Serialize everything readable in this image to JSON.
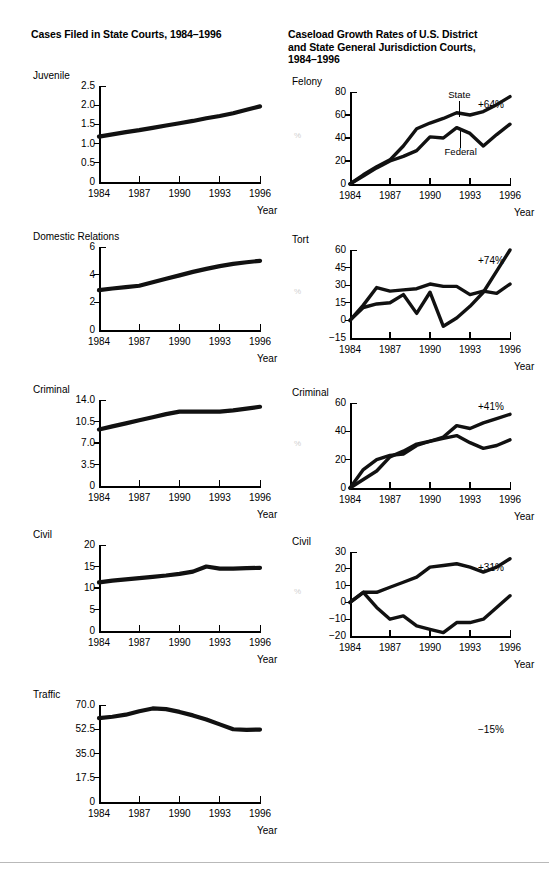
{
  "left_column": {
    "title": "Cases Filed in State Courts, 1984–1996",
    "xaxis_label": "Year"
  },
  "right_column": {
    "title": "Caseload Growth Rates of U.S. District\nand State General Jurisdiction Courts,\n1984–1996",
    "xaxis_label": "Year"
  },
  "felony_series_labels": {
    "state": "State",
    "federal": "Federal"
  },
  "footer": {
    "divider": ""
  },
  "chart_data": [
    {
      "id": "juvenile",
      "type": "line",
      "title": "Juvenile",
      "xlabel": "Year",
      "ylabel": "",
      "annotation": "+64%",
      "xticks": [
        "1984",
        "1987",
        "1990",
        "1993",
        "1996"
      ],
      "yticks": [
        "0",
        "0.5",
        "1.0",
        "1.5",
        "2.0",
        "2.5"
      ],
      "ylim": [
        0,
        2.5
      ],
      "xlim": [
        1984,
        1996
      ],
      "x": [
        1984,
        1985,
        1986,
        1987,
        1988,
        1989,
        1990,
        1991,
        1992,
        1993,
        1994,
        1995,
        1996
      ],
      "values": [
        1.18,
        1.24,
        1.3,
        1.35,
        1.41,
        1.47,
        1.53,
        1.59,
        1.66,
        1.72,
        1.79,
        1.88,
        1.97
      ]
    },
    {
      "id": "domestic-relations",
      "type": "line",
      "title": "Domestic Relations",
      "xlabel": "Year",
      "ylabel": "",
      "annotation": "+74%",
      "xticks": [
        "1984",
        "1987",
        "1990",
        "1993",
        "1996"
      ],
      "yticks": [
        "0",
        "2",
        "4",
        "6"
      ],
      "ylim": [
        0,
        6
      ],
      "xlim": [
        1984,
        1996
      ],
      "x": [
        1984,
        1985,
        1986,
        1987,
        1988,
        1989,
        1990,
        1991,
        1992,
        1993,
        1994,
        1995,
        1996
      ],
      "values": [
        2.88,
        3.0,
        3.1,
        3.2,
        3.45,
        3.7,
        3.95,
        4.2,
        4.42,
        4.62,
        4.78,
        4.9,
        5.0
      ]
    },
    {
      "id": "criminal-state",
      "type": "line",
      "title": "Criminal",
      "xlabel": "Year",
      "ylabel": "",
      "annotation": "+41%",
      "xticks": [
        "1984",
        "1987",
        "1990",
        "1993",
        "1996"
      ],
      "yticks": [
        "0",
        "3.5",
        "7.0",
        "10.5",
        "14.0"
      ],
      "ylim": [
        0,
        14
      ],
      "xlim": [
        1984,
        1996
      ],
      "x": [
        1984,
        1985,
        1986,
        1987,
        1988,
        1989,
        1990,
        1991,
        1992,
        1993,
        1994,
        1995,
        1996
      ],
      "values": [
        9.2,
        9.7,
        10.2,
        10.7,
        11.2,
        11.7,
        12.1,
        12.1,
        12.1,
        12.1,
        12.3,
        12.6,
        12.9
      ]
    },
    {
      "id": "civil-state",
      "type": "line",
      "title": "Civil",
      "xlabel": "Year",
      "ylabel": "",
      "annotation": "+31%",
      "xticks": [
        "1984",
        "1987",
        "1990",
        "1993",
        "1996"
      ],
      "yticks": [
        "0",
        "5",
        "10",
        "15",
        "20"
      ],
      "ylim": [
        0,
        20
      ],
      "xlim": [
        1984,
        1996
      ],
      "x": [
        1984,
        1985,
        1986,
        1987,
        1988,
        1989,
        1990,
        1991,
        1992,
        1993,
        1994,
        1995,
        1996
      ],
      "values": [
        11.3,
        11.7,
        12.0,
        12.3,
        12.6,
        12.9,
        13.3,
        13.8,
        15.0,
        14.5,
        14.5,
        14.6,
        14.7
      ]
    },
    {
      "id": "traffic",
      "type": "line",
      "title": "Traffic",
      "xlabel": "Year",
      "ylabel": "",
      "annotation": "−15%",
      "xticks": [
        "1984",
        "1987",
        "1990",
        "1993",
        "1996"
      ],
      "yticks": [
        "0",
        "17.5",
        "35.0",
        "52.5",
        "70.0"
      ],
      "ylim": [
        0,
        70
      ],
      "xlim": [
        1984,
        1996
      ],
      "x": [
        1984,
        1985,
        1986,
        1987,
        1988,
        1989,
        1990,
        1991,
        1992,
        1993,
        1994,
        1995,
        1996
      ],
      "values": [
        60.5,
        61.5,
        63.0,
        65.5,
        67.5,
        67.0,
        65.0,
        62.5,
        59.5,
        56.0,
        52.5,
        52.0,
        52.3
      ]
    },
    {
      "id": "felony-growth",
      "type": "line",
      "title": "Felony",
      "xlabel": "Year",
      "ylabel": "%",
      "annotation": "",
      "xticks": [
        "1984",
        "1987",
        "1990",
        "1993",
        "1996"
      ],
      "yticks": [
        "0",
        "20",
        "40",
        "60",
        "80"
      ],
      "ylim": [
        0,
        80
      ],
      "xlim": [
        1984,
        1996
      ],
      "x": [
        1984,
        1985,
        1986,
        1987,
        1988,
        1989,
        1990,
        1991,
        1992,
        1993,
        1994,
        1995,
        1996
      ],
      "series": [
        {
          "name": "State",
          "values": [
            0,
            8,
            15,
            21,
            33,
            48,
            53,
            57,
            62,
            60,
            63,
            69,
            76
          ]
        },
        {
          "name": "Federal",
          "values": [
            0,
            7,
            14,
            20,
            24,
            29,
            41,
            40,
            49,
            44,
            33,
            43,
            52
          ]
        }
      ]
    },
    {
      "id": "tort-growth",
      "type": "line",
      "title": "Tort",
      "xlabel": "Year",
      "ylabel": "%",
      "annotation": "",
      "xticks": [
        "1984",
        "1987",
        "1990",
        "1993",
        "1996"
      ],
      "yticks": [
        "−15",
        "0",
        "15",
        "30",
        "45",
        "60"
      ],
      "ylim": [
        -15,
        60
      ],
      "xlim": [
        1984,
        1996
      ],
      "x": [
        1984,
        1985,
        1986,
        1987,
        1988,
        1989,
        1990,
        1991,
        1992,
        1993,
        1994,
        1995,
        1996
      ],
      "series": [
        {
          "name": "State",
          "values": [
            0,
            13,
            28,
            25,
            26,
            27,
            31,
            29,
            29,
            22,
            25,
            23,
            31
          ]
        },
        {
          "name": "Federal",
          "values": [
            0,
            11,
            14,
            15,
            22,
            6,
            24,
            -5,
            2,
            12,
            24,
            42,
            60
          ]
        }
      ]
    },
    {
      "id": "criminal-growth",
      "type": "line",
      "title": "Criminal",
      "xlabel": "Year",
      "ylabel": "%",
      "annotation": "",
      "xticks": [
        "1984",
        "1987",
        "1990",
        "1993",
        "1996"
      ],
      "yticks": [
        "0",
        "20",
        "40",
        "60"
      ],
      "ylim": [
        0,
        60
      ],
      "xlim": [
        1984,
        1996
      ],
      "x": [
        1984,
        1985,
        1986,
        1987,
        1988,
        1989,
        1990,
        1991,
        1992,
        1993,
        1994,
        1995,
        1996
      ],
      "series": [
        {
          "name": "State",
          "values": [
            0,
            13,
            20,
            23,
            24,
            30,
            33,
            36,
            44,
            42,
            46,
            49,
            52
          ]
        },
        {
          "name": "Federal",
          "values": [
            0,
            6,
            12,
            22,
            26,
            31,
            33,
            35,
            37,
            32,
            28,
            30,
            34
          ]
        }
      ]
    },
    {
      "id": "civil-growth",
      "type": "line",
      "title": "Civil",
      "xlabel": "Year",
      "ylabel": "%",
      "annotation": "",
      "xticks": [
        "1984",
        "1987",
        "1990",
        "1993",
        "1996"
      ],
      "yticks": [
        "−20",
        "−10",
        "0",
        "10",
        "20",
        "30"
      ],
      "ylim": [
        -20,
        30
      ],
      "xlim": [
        1984,
        1996
      ],
      "x": [
        1984,
        1985,
        1986,
        1987,
        1988,
        1989,
        1990,
        1991,
        1992,
        1993,
        1994,
        1995,
        1996
      ],
      "series": [
        {
          "name": "State",
          "values": [
            0,
            6,
            6,
            9,
            12,
            15,
            21,
            22,
            23,
            21,
            18,
            21,
            26
          ]
        },
        {
          "name": "Federal",
          "values": [
            0,
            6,
            -3,
            -10,
            -8,
            -14,
            -16,
            -18,
            -12,
            -12,
            -10,
            -3,
            4
          ]
        }
      ]
    }
  ]
}
